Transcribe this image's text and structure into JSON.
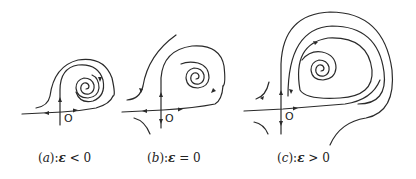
{
  "figure": {
    "panels": [
      {
        "id": "a",
        "origin_label": "O",
        "caption": {
          "prefix": "(",
          "letter": "a",
          "suffix": "):",
          "symbol": "ε",
          "relation": " < 0"
        },
        "condition": "ε < 0"
      },
      {
        "id": "b",
        "origin_label": "O",
        "caption": {
          "prefix": "(",
          "letter": "b",
          "suffix": "):",
          "symbol": "ε",
          "relation": " = 0"
        },
        "condition": "ε = 0"
      },
      {
        "id": "c",
        "origin_label": "O",
        "caption": {
          "prefix": "(",
          "letter": "c",
          "suffix": "):",
          "symbol": "ε",
          "relation": " > 0"
        },
        "condition": "ε > 0"
      }
    ],
    "colors": {
      "stroke": "#2a2a2a",
      "background": "#ffffff"
    }
  }
}
